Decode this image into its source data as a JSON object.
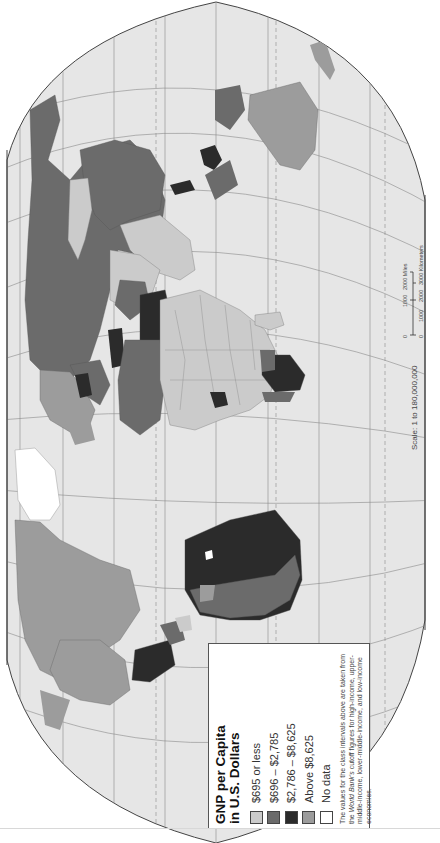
{
  "map": {
    "title": "GNP per Capita in U.S. Dollars",
    "orientation": "rotated 90° clockwise (north at left)",
    "projection_shape": "ellipse clipped by straight borders",
    "colors": {
      "ocean": "#e6e6e6",
      "graticule": "#8a8a8a",
      "border": "#7a7a7a",
      "frame": "#444444"
    }
  },
  "legend": {
    "title_line1": "GNP per Capita",
    "title_line2": "in U.S. Dollars",
    "items": [
      {
        "label": "$695 or less",
        "color": "#cbcbcb"
      },
      {
        "label": "$696 – $2,785",
        "color": "#6b6b6b"
      },
      {
        "label": "$2,786 – $8,625",
        "color": "#2b2b2b"
      },
      {
        "label": "Above $8,625",
        "color": "#9c9c9c"
      },
      {
        "label": "No data",
        "color": "#ffffff"
      }
    ],
    "note_part1": "The values for the class intervals above are taken from the ",
    "note_italic": "World Bank's",
    "note_part2": " cutoff figures for high-income, upper-middle-income, lower-middle-income, and low-income economies."
  },
  "scale": {
    "caption": "Scale: 1 to 180,000,000",
    "miles_ticks": [
      "0",
      "1000",
      "2000 Miles"
    ],
    "km_ticks": [
      "0",
      "1000",
      "2000",
      "3000 Kilometers"
    ]
  }
}
